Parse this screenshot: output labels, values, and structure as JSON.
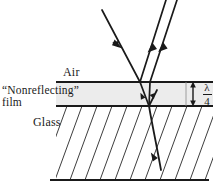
{
  "figure": {
    "labels": {
      "air": "Air",
      "film_line1": "“Nonreflecting”",
      "film_line2": "film",
      "glass": "Glass",
      "thickness_numerator": "λ",
      "thickness_denominator": "4"
    },
    "colors": {
      "ink": "#1a1a1a",
      "film_fill": "#ececec",
      "hatch": "#3d3d3d",
      "background": "#ffffff"
    },
    "geometry": {
      "top_interface_y": 82,
      "bottom_interface_y": 106,
      "glass_bottom_y": 180,
      "interface_x_start": 56,
      "interface_x_end": 213
    },
    "rays": [
      {
        "name": "incident-ray",
        "direction": "down-right",
        "arrow": "midpoint"
      },
      {
        "name": "reflected-ray-top-surface",
        "direction": "up-right",
        "arrow": "midpoint"
      },
      {
        "name": "reflected-ray-bottom-surface",
        "direction": "up-right",
        "arrow": "midpoint"
      },
      {
        "name": "internal-ray-down",
        "direction": "down-right",
        "arrow": "midpoint"
      },
      {
        "name": "internal-ray-up",
        "direction": "up-right",
        "arrow": "midpoint"
      },
      {
        "name": "transmitted-ray",
        "direction": "down-right",
        "arrow": "midpoint"
      }
    ],
    "media": [
      {
        "name": "air",
        "region": "above-top-interface"
      },
      {
        "name": "film",
        "region": "between-interfaces",
        "thickness": "λ/4"
      },
      {
        "name": "glass",
        "region": "below-bottom-interface",
        "fill": "hatched"
      }
    ]
  }
}
